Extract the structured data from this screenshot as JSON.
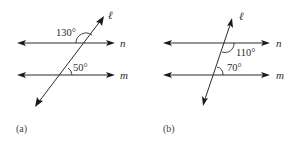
{
  "figures": [
    {
      "caption": "(a)",
      "transversal_label": "ℓ",
      "line_top_label": "n",
      "line_bottom_label": "m",
      "angle_top": "130°",
      "angle_bottom": "50°"
    },
    {
      "caption": "(b)",
      "transversal_label": "ℓ",
      "line_top_label": "n",
      "line_bottom_label": "m",
      "angle_top": "110°",
      "angle_bottom": "70°"
    }
  ],
  "colors": {
    "line": "#2b2b2b",
    "background": "#ffffff"
  }
}
